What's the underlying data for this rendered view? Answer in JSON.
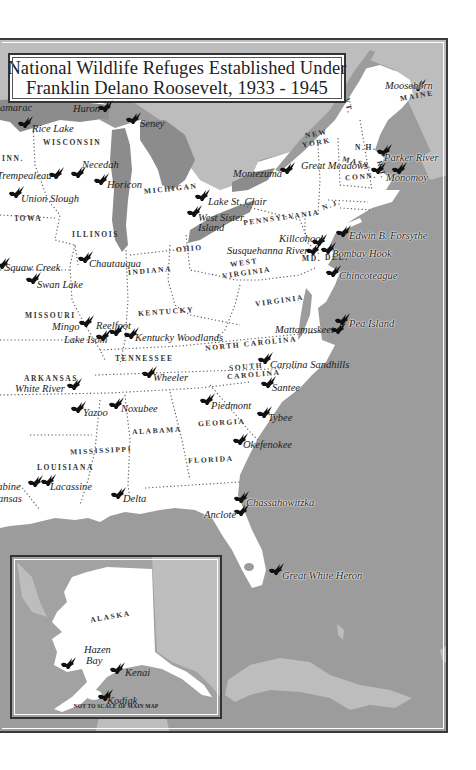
{
  "title": {
    "line1": "National Wildlife Refuges Established Under",
    "line2": "Franklin Delano Roosevelt, 1933 - 1945"
  },
  "colors": {
    "ocean": "#9c9c9c",
    "foreign_land": "#bdbdbd",
    "us_land": "#ffffff",
    "great_lakes": "#8c8c8c",
    "bird_icon": "#111111",
    "frame": "#333333"
  },
  "states": [
    {
      "name": "MAINE",
      "x": 400,
      "y": 90,
      "rot": -10
    },
    {
      "name": "N.H.",
      "x": 355,
      "y": 142,
      "rot": 0
    },
    {
      "name": "VT.",
      "x": 340,
      "y": 100,
      "rot": 80
    },
    {
      "name": "NEW",
      "x": 305,
      "y": 128,
      "rot": -10
    },
    {
      "name": "YORK",
      "x": 302,
      "y": 137,
      "rot": -10
    },
    {
      "name": "MASS.",
      "x": 342,
      "y": 157,
      "rot": 15
    },
    {
      "name": "CONN.",
      "x": 345,
      "y": 171,
      "rot": -5
    },
    {
      "name": "R.I.",
      "x": 372,
      "y": 164,
      "rot": 75
    },
    {
      "name": "N.J.",
      "x": 322,
      "y": 199,
      "rot": -20
    },
    {
      "name": "PENNSYLVANIA",
      "x": 243,
      "y": 212,
      "rot": -8
    },
    {
      "name": "DEL.",
      "x": 325,
      "y": 252,
      "rot": 0
    },
    {
      "name": "MD.",
      "x": 302,
      "y": 253,
      "rot": 0
    },
    {
      "name": "WISCONSIN",
      "x": 43,
      "y": 137,
      "rot": 0
    },
    {
      "name": "MICHIGAN",
      "x": 144,
      "y": 183,
      "rot": -6
    },
    {
      "name": "INN.",
      "x": 2,
      "y": 153,
      "rot": 0
    },
    {
      "name": "IOWA",
      "x": 15,
      "y": 213,
      "rot": 0
    },
    {
      "name": "ILLINOIS",
      "x": 72,
      "y": 229,
      "rot": 0
    },
    {
      "name": "OHIO",
      "x": 176,
      "y": 243,
      "rot": -5
    },
    {
      "name": "INDIANA",
      "x": 128,
      "y": 265,
      "rot": -5
    },
    {
      "name": "WEST",
      "x": 230,
      "y": 257,
      "rot": -8
    },
    {
      "name": "VIRGINIA",
      "x": 222,
      "y": 267,
      "rot": -8
    },
    {
      "name": "VIRGINIA",
      "x": 255,
      "y": 295,
      "rot": -8
    },
    {
      "name": "MISSOURI",
      "x": 25,
      "y": 310,
      "rot": 0
    },
    {
      "name": "KENTUCKY",
      "x": 138,
      "y": 306,
      "rot": -4
    },
    {
      "name": "NORTH CAROLINA",
      "x": 205,
      "y": 338,
      "rot": -6
    },
    {
      "name": "TENNESSEE",
      "x": 115,
      "y": 353,
      "rot": 0
    },
    {
      "name": "SOUTH",
      "x": 229,
      "y": 361,
      "rot": -5
    },
    {
      "name": "CAROLINA",
      "x": 227,
      "y": 369,
      "rot": -5
    },
    {
      "name": "ARKANSAS",
      "x": 24,
      "y": 373,
      "rot": 0
    },
    {
      "name": "GEORGIA",
      "x": 198,
      "y": 417,
      "rot": -3
    },
    {
      "name": "ALABAMA",
      "x": 132,
      "y": 425,
      "rot": -3
    },
    {
      "name": "MISSISSIPPI",
      "x": 70,
      "y": 445,
      "rot": -3
    },
    {
      "name": "FLORIDA",
      "x": 188,
      "y": 454,
      "rot": -3
    },
    {
      "name": "LOUISIANA",
      "x": 37,
      "y": 462,
      "rot": 0
    }
  ],
  "refuges": [
    {
      "name": "Mooseborn",
      "x": 385,
      "y": 78,
      "bx": 410,
      "by": 77,
      "water": true
    },
    {
      "name": "Huron",
      "x": 73,
      "y": 101,
      "bx": 97,
      "by": 98,
      "water": false
    },
    {
      "name": "Seney",
      "x": 140,
      "y": 116,
      "bx": 125,
      "by": 110,
      "water": false
    },
    {
      "name": "amarac",
      "x": 0,
      "y": 100,
      "bx": -30,
      "by": 0,
      "water": false,
      "nobird": true
    },
    {
      "name": "Rice Lake",
      "x": 32,
      "y": 121,
      "bx": 17,
      "by": 114,
      "water": false
    },
    {
      "name": "Necedah",
      "x": 82,
      "y": 157,
      "bx": 70,
      "by": 164,
      "water": false
    },
    {
      "name": "Trempealeau",
      "x": -3,
      "y": 168,
      "bx": 48,
      "by": 165,
      "water": false
    },
    {
      "name": "Horicon",
      "x": 107,
      "y": 177,
      "bx": 93,
      "by": 171,
      "water": false
    },
    {
      "name": "Union Slough",
      "x": 21,
      "y": 191,
      "bx": 8,
      "by": 184,
      "water": false
    },
    {
      "name": "Montezuma",
      "x": 233,
      "y": 166,
      "bx": 279,
      "by": 160,
      "water": false
    },
    {
      "name": "Great Meadows",
      "x": 301,
      "y": 158,
      "bx": 370,
      "by": 160,
      "water": false
    },
    {
      "name": "Parker River",
      "x": 384,
      "y": 150,
      "bx": 376,
      "by": 142,
      "water": true
    },
    {
      "name": "Monomoy",
      "x": 386,
      "y": 170,
      "bx": 391,
      "by": 160,
      "water": true
    },
    {
      "name": "Lake St. Clair",
      "x": 208,
      "y": 194,
      "bx": 194,
      "by": 187,
      "water": false
    },
    {
      "name": "West Sister",
      "x": 198,
      "y": 210,
      "bx": 186,
      "by": 203,
      "water": false
    },
    {
      "name": "Island",
      "x": 198,
      "y": 220,
      "bx": 0,
      "by": 0,
      "water": false,
      "nobird": true
    },
    {
      "name": "Killcohook",
      "x": 279,
      "y": 231,
      "bx": 311,
      "by": 232,
      "water": false
    },
    {
      "name": "Edwin B. Forsythe",
      "x": 349,
      "y": 228,
      "bx": 335,
      "by": 223,
      "water": true
    },
    {
      "name": "Susquehanna River",
      "x": 227,
      "y": 243,
      "bx": 305,
      "by": 241,
      "water": false
    },
    {
      "name": "Bombay Hook",
      "x": 332,
      "y": 246,
      "bx": 320,
      "by": 240,
      "water": true
    },
    {
      "name": "Chincoteague",
      "x": 339,
      "y": 268,
      "bx": 325,
      "by": 263,
      "water": true
    },
    {
      "name": "Squaw Creek",
      "x": 5,
      "y": 260,
      "bx": -6,
      "by": 255,
      "water": false
    },
    {
      "name": "Swan Lake",
      "x": 37,
      "y": 277,
      "bx": 25,
      "by": 270,
      "water": false
    },
    {
      "name": "Chautauqua",
      "x": 89,
      "y": 256,
      "bx": 77,
      "by": 249,
      "water": false
    },
    {
      "name": "Mingo",
      "x": 52,
      "y": 319,
      "bx": 78,
      "by": 313,
      "water": false
    },
    {
      "name": "Reelfoot",
      "x": 96,
      "y": 318,
      "bx": 108,
      "by": 322,
      "water": false
    },
    {
      "name": "Lake Isom",
      "x": 64,
      "y": 332,
      "bx": 95,
      "by": 327,
      "water": false
    },
    {
      "name": "Kentucky Woodlands",
      "x": 135,
      "y": 330,
      "bx": 123,
      "by": 325,
      "water": false
    },
    {
      "name": "Mattamuskeet",
      "x": 275,
      "y": 322,
      "bx": 330,
      "by": 320,
      "water": false
    },
    {
      "name": "Pea Island",
      "x": 349,
      "y": 316,
      "bx": 334,
      "by": 311,
      "water": true
    },
    {
      "name": "Carolina Sandhills",
      "x": 270,
      "y": 357,
      "bx": 257,
      "by": 350,
      "water": false
    },
    {
      "name": "White River",
      "x": 15,
      "y": 381,
      "bx": 66,
      "by": 376,
      "water": false
    },
    {
      "name": "Wheeler",
      "x": 153,
      "y": 370,
      "bx": 141,
      "by": 364,
      "water": false
    },
    {
      "name": "Santee",
      "x": 272,
      "y": 380,
      "bx": 260,
      "by": 374,
      "water": false
    },
    {
      "name": "Yazoo",
      "x": 83,
      "y": 405,
      "bx": 70,
      "by": 399,
      "water": false
    },
    {
      "name": "Noxubee",
      "x": 121,
      "y": 401,
      "bx": 108,
      "by": 395,
      "water": false
    },
    {
      "name": "Piedmont",
      "x": 211,
      "y": 398,
      "bx": 199,
      "by": 391,
      "water": false
    },
    {
      "name": "Tybee",
      "x": 268,
      "y": 410,
      "bx": 256,
      "by": 404,
      "water": false
    },
    {
      "name": "Okefenokee",
      "x": 243,
      "y": 437,
      "bx": 232,
      "by": 431,
      "water": false
    },
    {
      "name": "Sabine",
      "x": -8,
      "y": 479,
      "bx": 27,
      "by": 473,
      "water": true
    },
    {
      "name": "Lacassine",
      "x": 50,
      "y": 479,
      "bx": 40,
      "by": 472,
      "water": true
    },
    {
      "name": "ansas",
      "x": -2,
      "y": 491,
      "bx": 0,
      "by": 0,
      "water": true,
      "nobird": true
    },
    {
      "name": "Delta",
      "x": 123,
      "y": 491,
      "bx": 110,
      "by": 485,
      "water": true
    },
    {
      "name": "Chassahowitzka",
      "x": 246,
      "y": 495,
      "bx": 233,
      "by": 489,
      "water": true
    },
    {
      "name": "Anclote",
      "x": 204,
      "y": 507,
      "bx": 233,
      "by": 502,
      "water": true
    },
    {
      "name": "Great White Heron",
      "x": 282,
      "y": 568,
      "bx": 268,
      "by": 561,
      "water": true
    }
  ],
  "inset": {
    "region_label": "ALASKA",
    "note": "NOT TO SCALE OF MAIN MAP",
    "refuges": [
      {
        "name": "Hazen",
        "x": 72,
        "y": 87,
        "bx": 48,
        "by": 100
      },
      {
        "name": "Bay",
        "x": 74,
        "y": 98,
        "bx": 0,
        "by": 0,
        "nobird": true
      },
      {
        "name": "Kenai",
        "x": 113,
        "y": 110,
        "bx": 97,
        "by": 105
      },
      {
        "name": "Kodiak",
        "x": 95,
        "y": 138,
        "bx": 85,
        "by": 132
      }
    ]
  }
}
